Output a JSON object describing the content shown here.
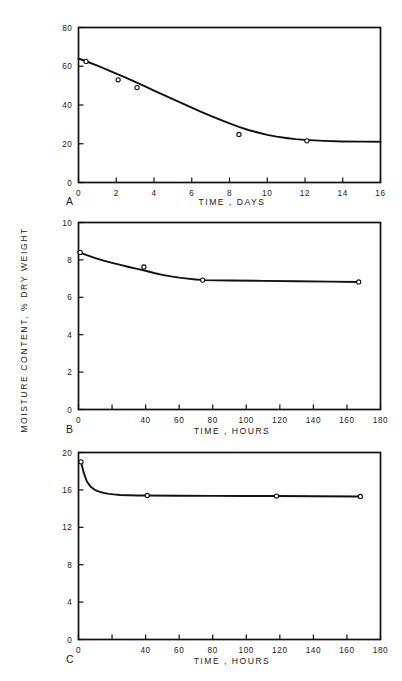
{
  "figure": {
    "shared_ylabel": "MOISTURE  CONTENT,  % DRY WEIGHT",
    "background_color": "#ffffff",
    "line_color": "#111111"
  },
  "chart_data": [
    {
      "type": "line",
      "panel": "A",
      "title": "",
      "xlabel": "TIME , DAYS",
      "ylabel": "MOISTURE CONTENT, % DRY WEIGHT",
      "xlim": [
        0,
        16
      ],
      "ylim": [
        0,
        80
      ],
      "xticks": [
        0,
        2,
        4,
        6,
        8,
        10,
        12,
        14,
        16
      ],
      "xticklabels": [
        "0",
        "2",
        "4",
        "6",
        "8",
        "10",
        "12",
        "14",
        "16"
      ],
      "yticks": [
        0,
        20,
        40,
        60,
        80
      ],
      "yticklabels": [
        "0",
        "20",
        "40",
        "60",
        "80"
      ],
      "grid": false,
      "legend": "none",
      "series": [
        {
          "name": "fitted curve",
          "style": "solid-line",
          "x": [
            0.0,
            0.5,
            1.0,
            1.5,
            2.0,
            2.5,
            3.0,
            3.5,
            4.0,
            4.5,
            5.0,
            5.5,
            6.0,
            6.5,
            7.0,
            7.5,
            8.0,
            8.5,
            9.0,
            9.5,
            10.0,
            10.5,
            11.0,
            11.5,
            12.0,
            13.0,
            14.0,
            15.0,
            16.0
          ],
          "y": [
            64.0,
            62.2,
            60.3,
            58.3,
            56.2,
            54.1,
            51.9,
            49.7,
            47.4,
            45.2,
            43.0,
            40.8,
            38.6,
            36.5,
            34.4,
            32.4,
            30.5,
            28.7,
            27.1,
            25.8,
            24.6,
            23.7,
            23.0,
            22.4,
            22.0,
            21.5,
            21.2,
            21.1,
            21.0
          ]
        },
        {
          "name": "data points",
          "style": "open-circle-markers",
          "x": [
            0.4,
            2.1,
            3.1,
            8.5,
            12.1
          ],
          "y": [
            62.5,
            53.0,
            49.0,
            24.8,
            21.5
          ]
        }
      ]
    },
    {
      "type": "line",
      "panel": "B",
      "title": "",
      "xlabel": "TIME , HOURS",
      "ylabel": "MOISTURE CONTENT, % DRY WEIGHT",
      "xlim": [
        0,
        180
      ],
      "ylim": [
        0,
        10
      ],
      "xticks": [
        0,
        20,
        40,
        60,
        80,
        100,
        120,
        140,
        160,
        180
      ],
      "xticklabels": [
        "0",
        "",
        "40",
        "60",
        "80",
        "100",
        "120",
        "140",
        "160",
        "180"
      ],
      "yticks": [
        0,
        2,
        4,
        6,
        8,
        10
      ],
      "yticklabels": [
        "0",
        "2",
        "4",
        "6",
        "8",
        "10"
      ],
      "grid": false,
      "legend": "none",
      "series": [
        {
          "name": "fitted curve",
          "style": "solid-line",
          "x": [
            0,
            5,
            10,
            15,
            20,
            25,
            30,
            35,
            40,
            45,
            50,
            55,
            60,
            65,
            70,
            75,
            90,
            110,
            130,
            150,
            167
          ],
          "y": [
            8.42,
            8.25,
            8.1,
            7.96,
            7.84,
            7.73,
            7.62,
            7.52,
            7.42,
            7.3,
            7.2,
            7.12,
            7.05,
            7.0,
            6.95,
            6.92,
            6.9,
            6.88,
            6.86,
            6.84,
            6.82
          ]
        },
        {
          "name": "data points",
          "style": "open-circle-markers",
          "x": [
            1.0,
            39.0,
            74.0,
            167.0
          ],
          "y": [
            8.4,
            7.62,
            6.92,
            6.82
          ]
        }
      ]
    },
    {
      "type": "line",
      "panel": "C",
      "title": "",
      "xlabel": "TIME , HOURS",
      "ylabel": "MOISTURE CONTENT, % DRY WEIGHT",
      "xlim": [
        0,
        180
      ],
      "ylim": [
        0,
        20
      ],
      "xticks": [
        0,
        20,
        40,
        60,
        80,
        100,
        120,
        140,
        160,
        180
      ],
      "xticklabels": [
        "0",
        "",
        "40",
        "60",
        "80",
        "100",
        "120",
        "140",
        "160",
        "180"
      ],
      "yticks": [
        0,
        4,
        8,
        12,
        16,
        20
      ],
      "yticklabels": [
        "0",
        "4",
        "8",
        "12",
        "16",
        "20"
      ],
      "grid": false,
      "legend": "none",
      "series": [
        {
          "name": "fitted curve",
          "style": "solid-line",
          "x": [
            1.5,
            3,
            5,
            7,
            9,
            11,
            13,
            15,
            18,
            21,
            25,
            30,
            35,
            41,
            60,
            80,
            100,
            118,
            140,
            168
          ],
          "y": [
            19.0,
            17.9,
            16.9,
            16.4,
            16.1,
            15.9,
            15.78,
            15.68,
            15.58,
            15.52,
            15.46,
            15.42,
            15.4,
            15.4,
            15.38,
            15.36,
            15.35,
            15.34,
            15.32,
            15.3
          ]
        },
        {
          "name": "data points",
          "style": "open-circle-markers",
          "x": [
            1.5,
            41.0,
            118.0,
            168.0
          ],
          "y": [
            19.0,
            15.4,
            15.34,
            15.3
          ]
        }
      ]
    }
  ],
  "panels": [
    {
      "letter": "A",
      "xlabel": "TIME , DAYS"
    },
    {
      "letter": "B",
      "xlabel": "TIME , HOURS"
    },
    {
      "letter": "C",
      "xlabel": "TIME , HOURS"
    }
  ]
}
